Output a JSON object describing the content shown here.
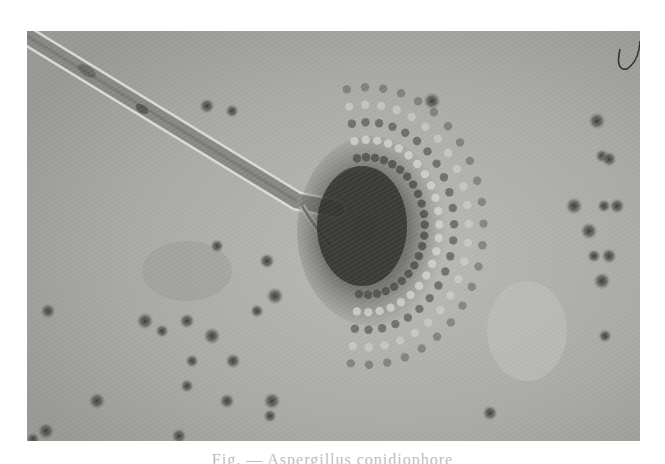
{
  "image": {
    "subject": "Micrograph of fungal conidiophore with radiating spore head",
    "mode": "grayscale",
    "background_color": "#a9a9a7",
    "page_color": "#ffffff",
    "frame": {
      "x": 27,
      "y": 31,
      "width": 613,
      "height": 410
    }
  },
  "features": {
    "hypha": {
      "from": [
        0,
        5
      ],
      "bend": [
        270,
        170
      ],
      "to": [
        310,
        178
      ],
      "width": 16,
      "fill": "#8e8e8a",
      "edge": "#d8d8d4"
    },
    "stalk_branch": {
      "from": [
        275,
        175
      ],
      "to": [
        305,
        215
      ]
    },
    "conidial_head": {
      "center": [
        320,
        190
      ],
      "rx": 70,
      "ry": 85,
      "core_color": "#2c2c2a"
    },
    "curly_fiber": {
      "x": 590,
      "y": 0
    }
  },
  "spores": [
    [
      205,
      80
    ],
    [
      180,
      75
    ],
    [
      405,
      70
    ],
    [
      190,
      215
    ],
    [
      240,
      230
    ],
    [
      248,
      265
    ],
    [
      230,
      280
    ],
    [
      21,
      280
    ],
    [
      118,
      290
    ],
    [
      135,
      300
    ],
    [
      160,
      290
    ],
    [
      185,
      305
    ],
    [
      165,
      330
    ],
    [
      206,
      330
    ],
    [
      70,
      370
    ],
    [
      160,
      355
    ],
    [
      200,
      370
    ],
    [
      245,
      370
    ],
    [
      243,
      385
    ],
    [
      152,
      405
    ],
    [
      19,
      400
    ],
    [
      6,
      408
    ],
    [
      463,
      382
    ],
    [
      570,
      90
    ],
    [
      575,
      125
    ],
    [
      582,
      128
    ],
    [
      547,
      175
    ],
    [
      577,
      175
    ],
    [
      590,
      175
    ],
    [
      562,
      200
    ],
    [
      567,
      225
    ],
    [
      582,
      225
    ],
    [
      575,
      250
    ],
    [
      578,
      305
    ],
    [
      25,
      418
    ]
  ],
  "caption": {
    "text": "Fig. — Aspergillus conidiophore",
    "visible": "partial (clipped at bottom edge)"
  }
}
